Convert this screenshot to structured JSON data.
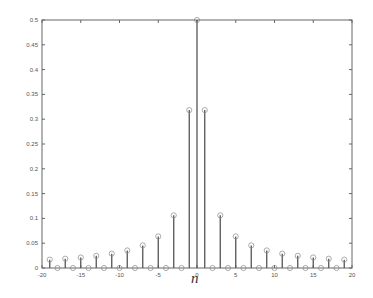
{
  "chart_data": {
    "type": "stem",
    "title": "",
    "xlabel": "n",
    "ylabel": "",
    "xlim": [
      -20,
      20
    ],
    "ylim": [
      0,
      0.5
    ],
    "grid": false,
    "x_ticks": [
      "-20",
      "-15",
      "-10",
      "-5",
      "0",
      "5",
      "10",
      "15",
      "20"
    ],
    "y_ticks": [
      "0",
      "0.05",
      "0.1",
      "0.15",
      "0.2",
      "0.25",
      "0.3",
      "0.35",
      "0.4",
      "0.45",
      "0.5"
    ],
    "x": [
      -19,
      -18,
      -17,
      -16,
      -15,
      -14,
      -13,
      -12,
      -11,
      -10,
      -9,
      -8,
      -7,
      -6,
      -5,
      -4,
      -3,
      -2,
      -1,
      0,
      1,
      2,
      3,
      4,
      5,
      6,
      7,
      8,
      9,
      10,
      11,
      12,
      13,
      14,
      15,
      16,
      17,
      18,
      19
    ],
    "values": [
      0.0168,
      0,
      0.0187,
      0,
      0.0212,
      0,
      0.0245,
      0,
      0.0289,
      0,
      0.0354,
      0,
      0.0455,
      0,
      0.0637,
      0,
      0.1061,
      0,
      0.3183,
      0.5,
      0.3183,
      0,
      0.1061,
      0,
      0.0637,
      0,
      0.0455,
      0,
      0.0354,
      0,
      0.0289,
      0,
      0.0245,
      0,
      0.0212,
      0,
      0.0187,
      0,
      0.0168
    ]
  },
  "colors": {
    "stem": "#555555",
    "axis": "#666666",
    "marker": "#888888"
  }
}
